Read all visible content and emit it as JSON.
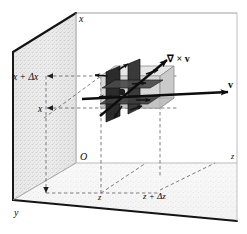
{
  "figure": {
    "caption": "",
    "background_color": "#ffffff",
    "ink_color": "#111111",
    "dashed_color": "#6a6a6a",
    "wall_fill_left": "#cfcfcf",
    "wall_fill_back": "#ffffff",
    "wall_fill_floor": "#e2e2e2",
    "slab_fill": "#d6d6d6",
    "blade_fill": "#2e2e2e"
  },
  "labels": {
    "axis_x": "x",
    "axis_y": "y",
    "axis_z": "z",
    "origin": "O",
    "x_lower": "x",
    "x_upper": "x + Δx",
    "z_lower": "z",
    "z_upper": "z + Δz",
    "curl_vector": "∇ × v",
    "velocity_vector": "v"
  },
  "vectors": [
    {
      "name": "curl-vector",
      "label": "∇ × v",
      "description": "bold arrow pointing up and to the right from the paddle wheel centre",
      "from": [
        108,
        112
      ],
      "to": [
        168,
        62
      ]
    },
    {
      "name": "velocity-vector",
      "label": "v",
      "description": "bold horizontal arrow pointing right through the paddle wheel",
      "from": [
        84,
        99
      ],
      "to": [
        232,
        92
      ]
    }
  ],
  "paddle_wheel": {
    "name": "paddle-wheel",
    "description": "small paddle wheel with four dark blades and small direction arrows, centred in the volume element",
    "blade_count": 4,
    "arrow_count": 8
  },
  "volume_element": {
    "name": "volume-element-slab",
    "description": "shaded rectangular slab between x and x + Δx, z and z + Δz"
  },
  "box": {
    "name": "coordinate-box",
    "description": "open rectangular box: shaded left wall, white back wall, shaded floor"
  },
  "guides": {
    "description": "dashed construction lines marking x, x + Δx on the vertical axis and z, z + Δz on the floor"
  }
}
